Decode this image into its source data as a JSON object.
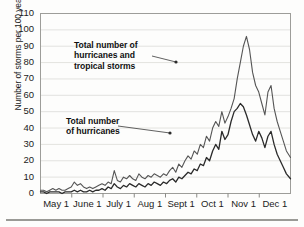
{
  "chart_data": {
    "type": "line",
    "title": "",
    "xlabel": "",
    "ylabel": "Number of storms per 100 years",
    "ylim": [
      0,
      110
    ],
    "ytick_values": [
      0,
      10,
      20,
      30,
      40,
      50,
      60,
      70,
      80,
      90,
      100,
      110
    ],
    "xtick_labels": [
      "May 1",
      "June 1",
      "July 1",
      "Aug 1",
      "Sept 1",
      "Oct 1",
      "Nov 1",
      "Dec 1"
    ],
    "grid": "horizontal",
    "legend_position": "inline-annotations",
    "annotations": [
      {
        "id": "upper",
        "text": "Total number of\nhurricanes and\ntropical storms",
        "target_series": "Total number of hurricanes and tropical storms"
      },
      {
        "id": "lower",
        "text": "Total number\nof hurricanes",
        "target_series": "Total number of hurricanes"
      }
    ],
    "x_unit": "days from May 1",
    "x_range_days": [
      0,
      244
    ],
    "series": [
      {
        "name": "Total number of hurricanes and tropical storms",
        "color": "#555555",
        "x": [
          0,
          3,
          6,
          9,
          12,
          15,
          18,
          21,
          24,
          27,
          30,
          33,
          36,
          39,
          42,
          45,
          48,
          51,
          54,
          57,
          60,
          63,
          66,
          69,
          72,
          75,
          78,
          81,
          84,
          87,
          90,
          93,
          96,
          99,
          102,
          105,
          108,
          111,
          114,
          117,
          120,
          123,
          126,
          129,
          132,
          135,
          138,
          141,
          144,
          147,
          150,
          153,
          156,
          159,
          162,
          165,
          168,
          171,
          174,
          177,
          180,
          183,
          186,
          189,
          192,
          195,
          198,
          201,
          204,
          207,
          210,
          213,
          216,
          219,
          222,
          225,
          228,
          231,
          234,
          237,
          240,
          244
        ],
        "values": [
          2,
          2,
          1,
          2,
          3,
          2,
          3,
          2,
          2,
          3,
          4,
          7,
          5,
          6,
          4,
          3,
          4,
          3,
          4,
          5,
          6,
          5,
          7,
          6,
          14,
          8,
          7,
          10,
          9,
          11,
          9,
          8,
          12,
          10,
          9,
          11,
          10,
          12,
          11,
          10,
          12,
          11,
          14,
          16,
          13,
          18,
          16,
          20,
          23,
          21,
          26,
          24,
          30,
          28,
          35,
          32,
          40,
          44,
          41,
          50,
          43,
          47,
          52,
          58,
          70,
          80,
          90,
          96,
          88,
          74,
          66,
          62,
          55,
          48,
          62,
          66,
          52,
          44,
          38,
          32,
          26,
          22
        ]
      },
      {
        "name": "Total number of hurricanes",
        "color": "#2b2b2b",
        "x": [
          0,
          3,
          6,
          9,
          12,
          15,
          18,
          21,
          24,
          27,
          30,
          33,
          36,
          39,
          42,
          45,
          48,
          51,
          54,
          57,
          60,
          63,
          66,
          69,
          72,
          75,
          78,
          81,
          84,
          87,
          90,
          93,
          96,
          99,
          102,
          105,
          108,
          111,
          114,
          117,
          120,
          123,
          126,
          129,
          132,
          135,
          138,
          141,
          144,
          147,
          150,
          153,
          156,
          159,
          162,
          165,
          168,
          171,
          174,
          177,
          180,
          183,
          186,
          189,
          192,
          195,
          198,
          201,
          204,
          207,
          210,
          213,
          216,
          219,
          222,
          225,
          228,
          231,
          234,
          237,
          240,
          244
        ],
        "values": [
          1,
          1,
          0,
          1,
          1,
          1,
          1,
          0,
          1,
          1,
          1,
          2,
          1,
          2,
          1,
          1,
          2,
          1,
          2,
          2,
          3,
          2,
          4,
          3,
          6,
          4,
          3,
          5,
          4,
          6,
          5,
          4,
          6,
          5,
          4,
          6,
          5,
          7,
          6,
          5,
          7,
          6,
          8,
          9,
          7,
          10,
          9,
          11,
          13,
          12,
          15,
          14,
          18,
          17,
          22,
          20,
          26,
          30,
          27,
          38,
          33,
          36,
          44,
          50,
          52,
          55,
          53,
          48,
          42,
          36,
          32,
          38,
          34,
          28,
          35,
          38,
          30,
          24,
          20,
          16,
          12,
          9
        ]
      }
    ]
  },
  "axes": {
    "y_ticks": [
      "0",
      "10",
      "20",
      "30",
      "40",
      "50",
      "60",
      "70",
      "80",
      "90",
      "100",
      "110"
    ],
    "y_axis_title": "Number of storms per 100 years",
    "x_ticks": [
      "May 1",
      "June 1",
      "July 1",
      "Aug 1",
      "Sept 1",
      "Oct 1",
      "Nov 1",
      "Dec 1"
    ]
  },
  "annotations": {
    "upper_label": "Total number of\nhurricanes and\ntropical storms",
    "lower_label": "Total number\nof hurricanes"
  }
}
